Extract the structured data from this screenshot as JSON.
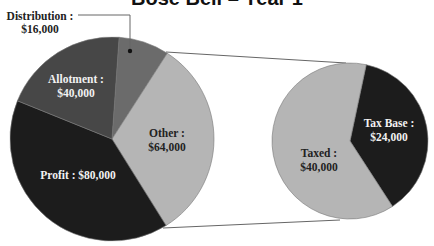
{
  "chart_data": {
    "type": "pie",
    "title_note": "title is clipped at top edge; only bottom portion of glyphs visible",
    "pies": [
      {
        "name": "main",
        "slices": [
          {
            "label": "Distribution",
            "value": 16000,
            "display": "$16,000",
            "color": "#6b6b6b"
          },
          {
            "label": "Other",
            "value": 64000,
            "display": "$64,000",
            "color": "#b5b5b5"
          },
          {
            "label": "Profit",
            "value": 80000,
            "display": "$80,000",
            "color": "#1c1c1c"
          },
          {
            "label": "Allotment",
            "value": 40000,
            "display": "$40,000",
            "color": "#474747"
          }
        ]
      },
      {
        "name": "breakout-of-other",
        "slices": [
          {
            "label": "Tax Base",
            "value": 24000,
            "display": "$24,000",
            "color": "#1c1c1c"
          },
          {
            "label": "Taxed",
            "value": 40000,
            "display": "$40,000",
            "color": "#b5b5b5"
          }
        ]
      }
    ],
    "legend": "none (data labels on slices)"
  },
  "labels": {
    "title": "Bose Bell – Year 1",
    "distribution_name": "Distribution :",
    "distribution_value": "$16,000",
    "allotment_name": "Allotment :",
    "allotment_value": "$40,000",
    "other_name": "Other :",
    "other_value": "$64,000",
    "profit_full": "Profit : $80,000",
    "taxbase_name": "Tax Base :",
    "taxbase_value": "$24,000",
    "taxed_name": "Taxed :",
    "taxed_value": "$40,000"
  }
}
